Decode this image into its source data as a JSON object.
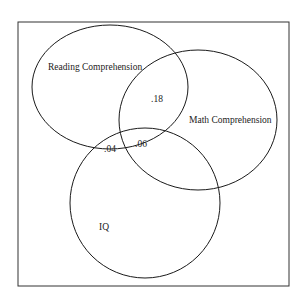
{
  "diagram": {
    "type": "venn",
    "colors": {
      "stroke": "#1a1a1a",
      "background": "#ffffff",
      "frame": "#333333"
    },
    "sets": [
      {
        "id": "reading",
        "label": "Reading Comprehension"
      },
      {
        "id": "math",
        "label": "Math Comprehension"
      },
      {
        "id": "iq",
        "label": "IQ"
      }
    ],
    "intersections": [
      {
        "sets": [
          "reading",
          "math"
        ],
        "value": ".18"
      },
      {
        "sets": [
          "reading",
          "iq"
        ],
        "value": ".04"
      },
      {
        "sets": [
          "reading",
          "math",
          "iq"
        ],
        "value": ".06"
      }
    ]
  }
}
